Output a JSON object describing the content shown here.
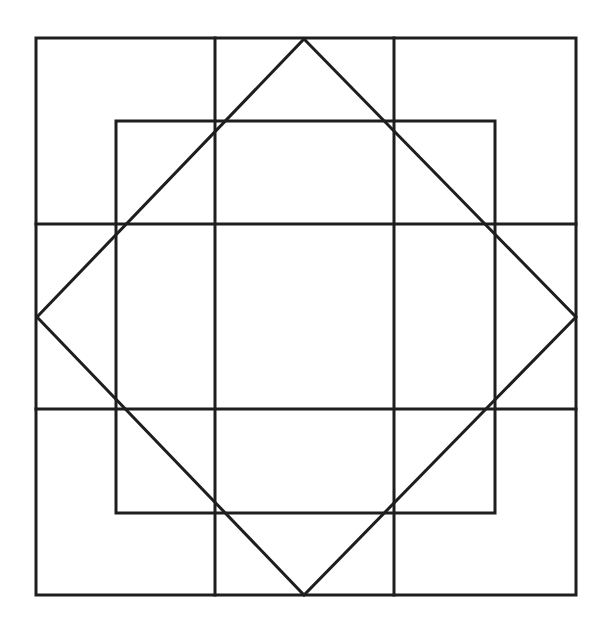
{
  "diagram": {
    "title": "",
    "stroke_color": "#1e1e1e",
    "background_color": "#ffffff",
    "grid_divisions": 3,
    "shapes": [
      {
        "name": "outer-square",
        "kind": "square"
      },
      {
        "name": "inner-square",
        "kind": "square"
      },
      {
        "name": "diamond",
        "kind": "rotated-square"
      },
      {
        "name": "grid-lines",
        "kind": "3x3-grid"
      }
    ]
  }
}
